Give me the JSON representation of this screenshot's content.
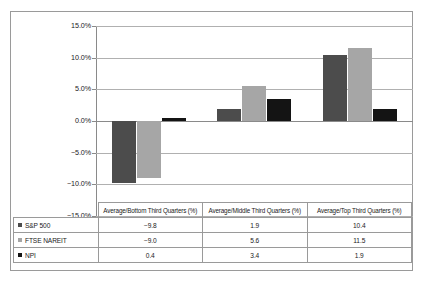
{
  "chart_data": {
    "type": "bar",
    "title": "",
    "subtitle": "",
    "xlabel": "",
    "ylabel": "",
    "categories": [
      "Average/Bottom Third Quarters (%)",
      "Average/Middle Third Quarters (%)",
      "Average/Top Third Quarters (%)"
    ],
    "series": [
      {
        "name": "S&P 500",
        "values": [
          -9.8,
          1.9,
          10.4
        ],
        "color": "#4c4c4c",
        "marker": "square"
      },
      {
        "name": "FTSE NAREIT",
        "values": [
          -9.0,
          5.6,
          11.5
        ],
        "color": "#a6a6a6",
        "marker": "square"
      },
      {
        "name": "NPI",
        "values": [
          0.4,
          3.4,
          1.9
        ],
        "color": "#141414",
        "marker": "square"
      }
    ],
    "ylim": [
      -15.0,
      15.0
    ],
    "ytick_values": [
      15.0,
      10.0,
      5.0,
      0.0,
      -5.0,
      -10.0,
      -15.0
    ],
    "ytick_labels": [
      "15.0%",
      "10.0%",
      "5.0%",
      "0.0%",
      "-5.0%",
      "-10.0%",
      "-15.0%"
    ],
    "grid": true,
    "grid_axis": "y",
    "legend_position": "data-table-left-column",
    "has_data_table": true,
    "value_format": "one-decimal"
  },
  "data_table": {
    "header_blank": "",
    "headers": [
      "Average/Bottom Third Quarters (%)",
      "Average/Middle Third Quarters (%)",
      "Average/Top Third Quarters (%)"
    ],
    "rows": [
      {
        "label": "S&P 500",
        "cells": [
          "-9.8",
          "1.9",
          "10.4"
        ]
      },
      {
        "label": "FTSE NAREIT",
        "cells": [
          "-9.0",
          "5.6",
          "11.5"
        ]
      },
      {
        "label": "NPI",
        "cells": [
          "0.4",
          "3.4",
          "1.9"
        ]
      }
    ]
  },
  "colors": {
    "series_1": "#4c4c4c",
    "series_2": "#a6a6a6",
    "series_3": "#141414",
    "gridline": "#b0b0b0",
    "axis": "#8a8a8a",
    "border": "#9a9a9a",
    "background": "#ffffff",
    "text": "#1a1a1a"
  }
}
